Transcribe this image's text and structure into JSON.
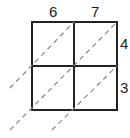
{
  "diagram": {
    "type": "lattice-multiplication-grid",
    "top_digits": [
      "6",
      "7"
    ],
    "right_digits": [
      "4",
      "3"
    ],
    "line_color": "#222222",
    "diagonal_color": "#888888"
  }
}
